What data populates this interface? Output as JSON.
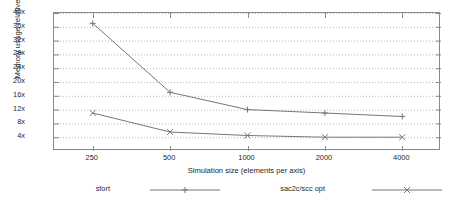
{
  "chart_data": {
    "type": "line",
    "title": "",
    "xlabel": "Simulation size (elements per axis)",
    "ylabel": "Memory usage relative to array size",
    "categories": [
      "250",
      "500",
      "1000",
      "2000",
      "4000"
    ],
    "x_tick_labels": [
      "250",
      "500",
      "1000",
      "2000",
      "4000"
    ],
    "y_tick_labels": [
      "4x",
      "8x",
      "12x",
      "16x",
      "20x",
      "24x",
      "28x",
      "32x",
      "36x",
      "40x"
    ],
    "y_tick_values": [
      4,
      8,
      12,
      16,
      20,
      24,
      28,
      32,
      36,
      40
    ],
    "ylim": [
      0,
      40
    ],
    "grid": "horizontal-dotted",
    "legend_position": "below",
    "series": [
      {
        "name": "sfort",
        "marker": "plus",
        "color": "#777777",
        "values": [
          37,
          17,
          12,
          11,
          10
        ]
      },
      {
        "name": "sac2c/scc opt",
        "marker": "cross",
        "color": "#777777",
        "values": [
          11,
          5.5,
          4.5,
          4,
          4
        ]
      }
    ]
  },
  "legend": {
    "entries": [
      {
        "label": "sfort"
      },
      {
        "label": "sac2c/scc opt"
      }
    ]
  },
  "colors": {
    "frame": "#8a8a8a",
    "grid": "#b9b9b9",
    "line": "#777777",
    "text": "#1f1f1f",
    "background": "#ffffff"
  }
}
